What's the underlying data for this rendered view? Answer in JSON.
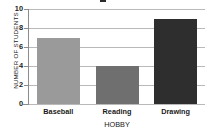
{
  "chart_data": {
    "type": "bar",
    "title": "",
    "xlabel": "HOBBY",
    "ylabel": "NUMBER OF STUDENTS",
    "categories": [
      "Baseball",
      "Reading",
      "Drawing"
    ],
    "values": [
      7,
      4,
      9
    ],
    "ylim": [
      0,
      10
    ],
    "yticks": [
      0,
      2,
      4,
      6,
      8,
      10
    ],
    "ytick_labels": [
      "0",
      "2",
      "4",
      "6",
      "8",
      "10"
    ],
    "grid": true,
    "legend": false,
    "bar_colors": [
      "#9a9a9a",
      "#6f6f6f",
      "#2e2e2e"
    ],
    "gridline_color": "#b9b9b9",
    "axis_color": "#8c8c8c",
    "background": "#ffffff"
  }
}
